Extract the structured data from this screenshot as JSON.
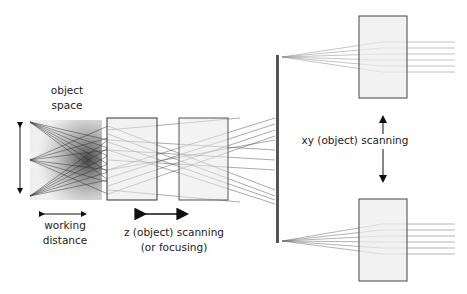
{
  "labels": {
    "object_space_1": "object",
    "object_space_2": "space",
    "working_distance_1": "working",
    "working_distance_2": "distance",
    "z_scanning_1": "z (object) scanning",
    "z_scanning_2": "(or focusing)",
    "xy_scanning": "xy (object) scanning"
  },
  "colors": {
    "box_fill": "#ececec",
    "box_stroke": "#444444",
    "ray": "#555555",
    "mirror": "#555555",
    "arrow": "#111111"
  }
}
